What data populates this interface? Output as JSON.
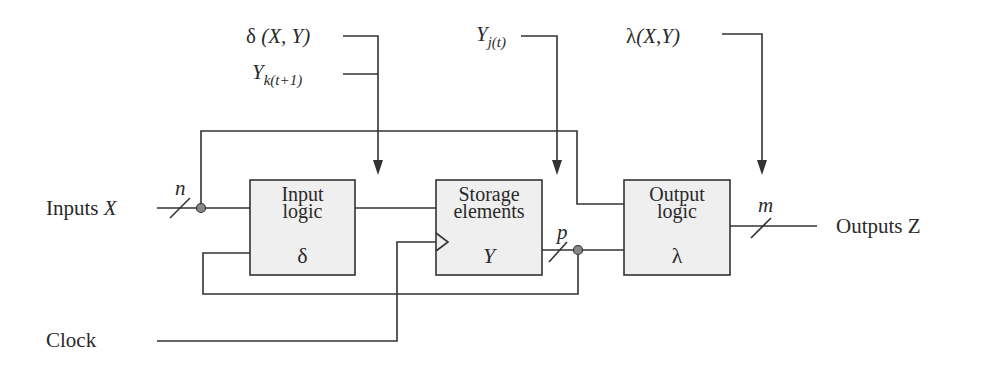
{
  "diagram": {
    "type": "sequential-circuit-block-diagram",
    "annotations": {
      "delta_func": {
        "symbol": "δ",
        "args": "(X, Y)"
      },
      "y_next": {
        "base": "Y",
        "sub": "k(t+1)"
      },
      "y_current": {
        "base": "Y",
        "sub": "j(t)"
      },
      "lambda_func": {
        "symbol": "λ",
        "args": "(X,Y)"
      }
    },
    "blocks": [
      {
        "id": "input-logic",
        "line1": "Input",
        "line2": "logic",
        "symbol": "δ"
      },
      {
        "id": "storage-elements",
        "line1": "Storage",
        "line2": "elements",
        "symbol": "Y"
      },
      {
        "id": "output-logic",
        "line1": "Output",
        "line2": "logic",
        "symbol": "λ"
      }
    ],
    "signals": {
      "inputs": {
        "label": "Inputs",
        "var": "X",
        "width": "n"
      },
      "state_bus_width": "p",
      "outputs": {
        "label": "Outputs",
        "var": "Z",
        "width": "m"
      },
      "clock": {
        "label": "Clock"
      }
    },
    "colors": {
      "line": "#333333",
      "block_fill": "#efefef",
      "junction": "#888888"
    }
  }
}
